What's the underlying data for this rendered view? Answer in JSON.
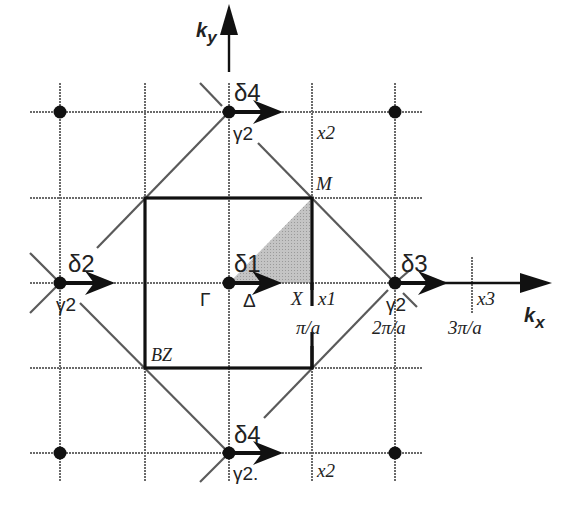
{
  "diagram": {
    "axes": {
      "ky_label": "k",
      "ky_sub": "y",
      "kx_label": "k",
      "kx_sub": "x"
    },
    "points": {
      "gamma": "Γ",
      "delta": "Δ",
      "x_point": "X",
      "m_point": "M",
      "bz": "BZ"
    },
    "ticks": {
      "pi_a": "π/a",
      "two_pi_a": "2π/a",
      "three_pi_a": "3π/a"
    },
    "vectors": {
      "d1": "δ1",
      "d2": "δ2",
      "d3": "δ3",
      "d4_top": "δ4",
      "d4_bottom": "δ4"
    },
    "gammas": {
      "left": "γ2",
      "right": "γ2",
      "top": "γ2",
      "bottom": "γ2."
    },
    "x_labels": {
      "x1": "x1",
      "x2_top": "x2",
      "x2_bottom": "x2",
      "x3": "x3"
    },
    "colors": {
      "line": "#111111",
      "grid": "#6a6a6a",
      "shaded": "#b8b8b8"
    }
  }
}
